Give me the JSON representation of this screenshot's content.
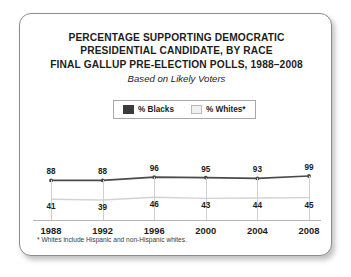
{
  "card": {
    "title_lines": [
      "PERCENTAGE SUPPORTING DEMOCRATIC",
      "PRESIDENTIAL CANDIDATE, BY RACE",
      "FINAL GALLUP PRE-ELECTION POLLS, 1988–2008"
    ],
    "subtitle": "Based on Likely Voters",
    "footnote": "* Whites include Hispanic and non-Hispanic whites."
  },
  "legend": {
    "items": [
      {
        "label": "% Blacks",
        "swatch": "dark-square",
        "color": "#3b3b3b"
      },
      {
        "label": "% Whites*",
        "swatch": "light-square",
        "color": "#f0f0f0"
      }
    ]
  },
  "chart_data": {
    "type": "line",
    "title": "PERCENTAGE SUPPORTING DEMOCRATIC PRESIDENTIAL CANDIDATE, BY RACE FINAL GALLUP PRE-ELECTION POLLS, 1988–2008",
    "subtitle": "Based on Likely Voters",
    "xlabel": "",
    "ylabel": "",
    "categories": [
      "1988",
      "1992",
      "1996",
      "2000",
      "2004",
      "2008"
    ],
    "series": [
      {
        "name": "% Blacks",
        "color": "#4a4a4a",
        "values": [
          88,
          88,
          96,
          95,
          93,
          99
        ]
      },
      {
        "name": "% Whites*",
        "color": "#d2d2d2",
        "values": [
          41,
          39,
          46,
          43,
          44,
          45
        ]
      }
    ],
    "ylim": [
      0,
      100
    ],
    "grid": "vertical",
    "legend_position": "top-center",
    "annotations": [
      "* Whites include Hispanic and non-Hispanic whites."
    ]
  }
}
